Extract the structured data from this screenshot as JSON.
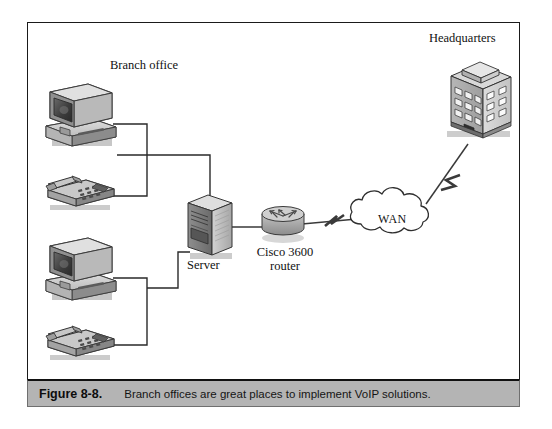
{
  "figure": {
    "caption_number": "Figure 8-8.",
    "caption_text": "Branch offices are great places to implement VoIP solutions."
  },
  "diagram": {
    "type": "network-topology",
    "labels": {
      "branch_office": "Branch office",
      "headquarters": "Headquarters",
      "server": "Server",
      "router": "Cisco 3600 router",
      "wan": "WAN"
    },
    "nodes": [
      {
        "id": "workstation-top",
        "icon": "desktop-computer-icon",
        "label": "",
        "x": 78,
        "y": 108
      },
      {
        "id": "phone-top",
        "icon": "desk-phone-icon",
        "label": "",
        "x": 78,
        "y": 190
      },
      {
        "id": "workstation-bottom",
        "icon": "desktop-computer-icon",
        "label": "",
        "x": 78,
        "y": 262
      },
      {
        "id": "phone-bottom",
        "icon": "desk-phone-icon",
        "label": "",
        "x": 78,
        "y": 340
      },
      {
        "id": "server",
        "icon": "tower-server-icon",
        "label": "Server",
        "x": 210,
        "y": 228
      },
      {
        "id": "router",
        "icon": "cisco-router-icon",
        "label": "Cisco 3600 router",
        "x": 283,
        "y": 220
      },
      {
        "id": "wan",
        "icon": "cloud-icon",
        "label": "WAN",
        "x": 400,
        "y": 222
      },
      {
        "id": "headquarters",
        "icon": "office-building-icon",
        "label": "Headquarters",
        "x": 477,
        "y": 95
      }
    ],
    "links": [
      {
        "from": "workstation-top",
        "to": "server",
        "style": "orthogonal"
      },
      {
        "from": "phone-top",
        "to": "server",
        "style": "orthogonal"
      },
      {
        "from": "workstation-bottom",
        "to": "server",
        "style": "orthogonal"
      },
      {
        "from": "phone-bottom",
        "to": "server",
        "style": "orthogonal"
      },
      {
        "from": "server",
        "to": "router",
        "style": "straight"
      },
      {
        "from": "router",
        "to": "wan",
        "style": "serial-lightning"
      },
      {
        "from": "wan",
        "to": "headquarters",
        "style": "serial-lightning"
      }
    ]
  },
  "colors": {
    "frame_border": "#1a1a1a",
    "caption_background": "#b4b4b4",
    "line": "#2a2a2a",
    "icon_light": "#d4d4d4",
    "icon_mid": "#a8a8a8",
    "icon_dark": "#6d6d6d",
    "icon_darkest": "#3a3a3a",
    "page_background": "#ffffff"
  }
}
